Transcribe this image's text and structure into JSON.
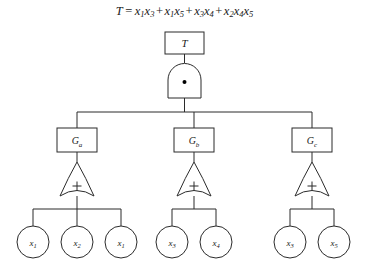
{
  "diagram": {
    "title_formula": {
      "lhs": "T",
      "eq": "=",
      "terms": [
        {
          "vars": [
            {
              "base": "x",
              "sub": "1"
            },
            {
              "base": "x",
              "sub": "3"
            }
          ]
        },
        {
          "vars": [
            {
              "base": "x",
              "sub": "1"
            },
            {
              "base": "x",
              "sub": "5"
            }
          ]
        },
        {
          "vars": [
            {
              "base": "x",
              "sub": "3"
            },
            {
              "base": "x",
              "sub": "4"
            }
          ]
        },
        {
          "vars": [
            {
              "base": "x",
              "sub": "2"
            },
            {
              "base": "x",
              "sub": "4"
            },
            {
              "base": "x",
              "sub": "5"
            }
          ]
        }
      ],
      "operator": "+",
      "plain": "T = x1x3 + x1x5 + x3x4 + x2x4x5"
    },
    "top_event": {
      "label_base": "T",
      "label_sub": ""
    },
    "and_gate": {
      "symbol": "dot",
      "symbol_char": "•"
    },
    "gates": [
      {
        "id": "Ga",
        "base": "G",
        "sub": "a",
        "op_symbol": "+"
      },
      {
        "id": "Gb",
        "base": "G",
        "sub": "b",
        "op_symbol": "+"
      },
      {
        "id": "Gc",
        "base": "G",
        "sub": "c",
        "op_symbol": "+"
      }
    ],
    "leaves": [
      {
        "group": "Ga",
        "base": "x",
        "sub": "1"
      },
      {
        "group": "Ga",
        "base": "x",
        "sub": "2"
      },
      {
        "group": "Ga",
        "base": "x",
        "sub": "1"
      },
      {
        "group": "Gb",
        "base": "x",
        "sub": "3"
      },
      {
        "group": "Gb",
        "base": "x",
        "sub": "4"
      },
      {
        "group": "Gc",
        "base": "x",
        "sub": "3"
      },
      {
        "group": "Gc",
        "base": "x",
        "sub": "5"
      }
    ],
    "colors": {
      "stroke": "#2b2b2b",
      "text": "#1a1a1a",
      "background": "#ffffff",
      "dot": "#000000"
    }
  }
}
